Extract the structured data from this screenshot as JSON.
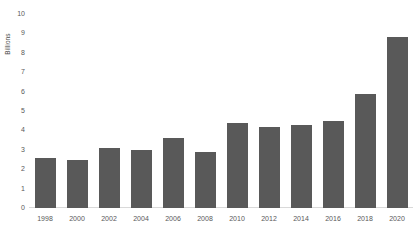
{
  "chart_data": {
    "type": "bar",
    "title": "",
    "xlabel": "",
    "ylabel": "Billions",
    "categories": [
      "1998",
      "2000",
      "2002",
      "2004",
      "2006",
      "2008",
      "2010",
      "2012",
      "2014",
      "2016",
      "2018",
      "2020"
    ],
    "values": [
      2.6,
      2.5,
      3.1,
      3.0,
      3.6,
      2.9,
      4.4,
      4.2,
      4.3,
      4.5,
      5.9,
      8.8
    ],
    "ylim": [
      0,
      10
    ],
    "ytick_labels": [
      "0",
      "1",
      "2",
      "3",
      "4",
      "5",
      "6",
      "7",
      "8",
      "9",
      "10"
    ],
    "ytick_values": [
      0,
      1,
      2,
      3,
      4,
      5,
      6,
      7,
      8,
      9,
      10
    ],
    "grid": false,
    "legend": null,
    "bar_color": "#595959",
    "axis_text_color": "#595959",
    "baseline_color": "#d9d9d9",
    "background": "#ffffff"
  }
}
